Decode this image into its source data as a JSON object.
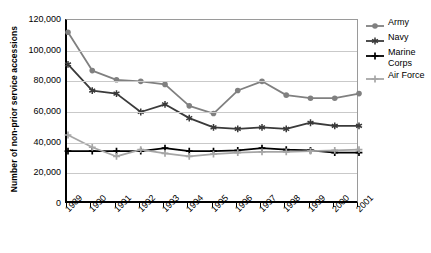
{
  "chart_data": {
    "type": "line",
    "title": "",
    "xlabel": "",
    "ylabel": "Number of non-prior service accessions",
    "categories": [
      "1989",
      "1990",
      "1991",
      "1992",
      "1993",
      "1994",
      "1995",
      "1996",
      "1997",
      "1998",
      "1999",
      "2000",
      "2001"
    ],
    "x": [
      1989,
      1990,
      1991,
      1992,
      1993,
      1994,
      1995,
      1996,
      1997,
      1998,
      1999,
      2000,
      2001
    ],
    "ylim": [
      0,
      120000
    ],
    "yticks": [
      0,
      20000,
      40000,
      60000,
      80000,
      100000,
      120000
    ],
    "ytick_labels": [
      "0",
      "20,000",
      "40,000",
      "60,000",
      "80,000",
      "100,000",
      "120,000"
    ],
    "grid": true,
    "legend_position": "right",
    "series": [
      {
        "name": "Army",
        "color": "#808080",
        "marker": "circle",
        "values": [
          112000,
          87000,
          81000,
          80000,
          78000,
          64000,
          59000,
          74000,
          80000,
          71000,
          69000,
          69000,
          72000
        ]
      },
      {
        "name": "Navy",
        "color": "#3a3a3a",
        "marker": "asterisk",
        "values": [
          91000,
          74000,
          72000,
          60000,
          65000,
          56000,
          50000,
          49000,
          50000,
          49000,
          53000,
          51000,
          51000
        ]
      },
      {
        "name": "Marine Corps",
        "color": "#000000",
        "marker": "plus",
        "values": [
          34500,
          34500,
          34500,
          34500,
          36500,
          34500,
          34500,
          35000,
          36500,
          35500,
          35000,
          33500,
          33500
        ]
      },
      {
        "name": "Air Force",
        "color": "#a6a6a6",
        "marker": "plus",
        "values": [
          45000,
          37000,
          31000,
          35500,
          33000,
          31000,
          32500,
          33500,
          34000,
          34000,
          34500,
          35000,
          35500
        ]
      }
    ]
  },
  "legend": {
    "items": [
      {
        "label": "Army"
      },
      {
        "label": "Navy"
      },
      {
        "label": "Marine Corps"
      },
      {
        "label": "Air Force"
      }
    ]
  }
}
